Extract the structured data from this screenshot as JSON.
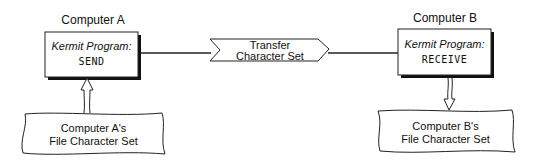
{
  "computer_a": {
    "title": "Computer A",
    "program_label": "Kermit Program:",
    "program_command": "SEND",
    "file_charset_line1": "Computer A's",
    "file_charset_line2": "File Character Set"
  },
  "transfer": {
    "line1": "Transfer",
    "line2": "Character Set"
  },
  "computer_b": {
    "title": "Computer B",
    "program_label": "Kermit Program:",
    "program_command": "RECEIVE",
    "file_charset_line1": "Computer B's",
    "file_charset_line2": "File Character Set"
  },
  "colors": {
    "stroke": "#222222",
    "shadow": "#111111",
    "background": "#ffffff"
  }
}
